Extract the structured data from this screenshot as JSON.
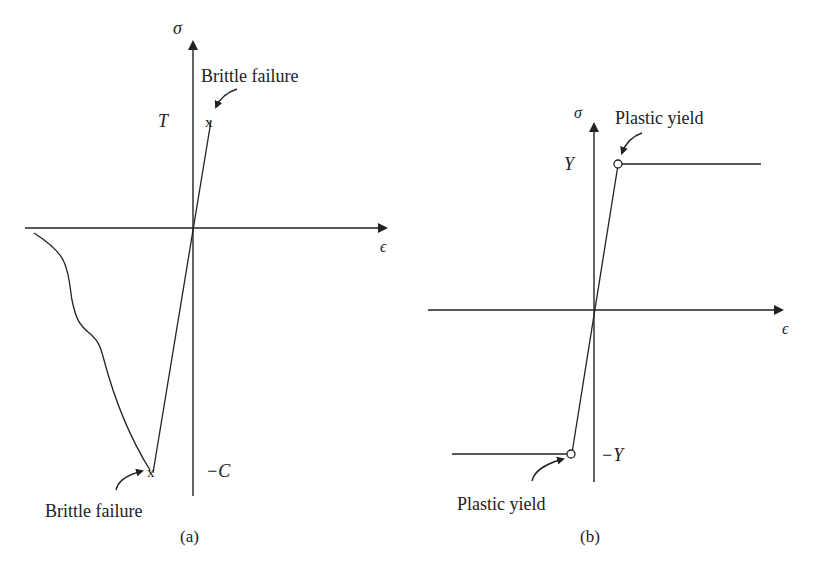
{
  "panels": [
    {
      "id": "a",
      "caption": "(a)",
      "y_axis_label": "σ",
      "x_axis_label": "ϵ",
      "tick_top": "T",
      "tick_bottom": "−C",
      "annotation_top": "Brittle failure",
      "annotation_bottom": "Brittle failure",
      "marker_top": "x",
      "marker_bottom": "x"
    },
    {
      "id": "b",
      "caption": "(b)",
      "y_axis_label": "σ",
      "x_axis_label": "ϵ",
      "tick_top": "Y",
      "tick_bottom": "−Y",
      "annotation_top": "Plastic yield",
      "annotation_bottom": "Plastic yield"
    }
  ],
  "colors": {
    "ink": "#222222",
    "background": "#ffffff"
  }
}
